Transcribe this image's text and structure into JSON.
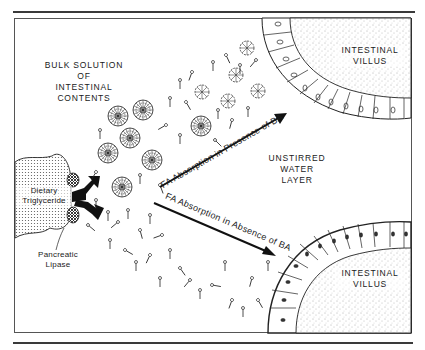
{
  "diagram": {
    "bulk_solution_label": {
      "line1": "BULK SOLUTION",
      "line2": "OF",
      "line3": "INTESTINAL",
      "line4": "CONTENTS"
    },
    "villus_top_label": {
      "line1": "INTESTINAL",
      "line2": "VILLUS"
    },
    "villus_bottom_label": {
      "line1": "INTESTINAL",
      "line2": "VILLUS"
    },
    "unstirred_label": {
      "line1": "UNSTIRRED",
      "line2": "WATER",
      "line3": "LAYER"
    },
    "triglyceride_label": {
      "line1": "Dietary",
      "line2": "Triglyceride"
    },
    "lipase_label": {
      "line1": "Pancreatic",
      "line2": "Lipase"
    },
    "arrow_presence_label": "FA Absorption in Presence of BA",
    "arrow_absence_label": "FA Absorption in Absence of BA",
    "colors": {
      "ink": "#1a1a1a",
      "background": "#ffffff",
      "stipple": "#6a6a6a"
    }
  }
}
